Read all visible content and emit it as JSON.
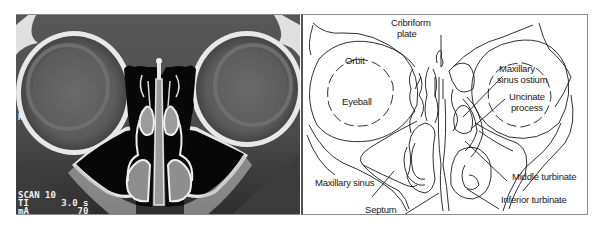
{
  "figure": {
    "left_panel": {
      "type": "coronal CT scan of paranasal sinuses",
      "orientation_marker": "R",
      "scan_info": [
        {
          "key": "SCAN",
          "value": "10"
        },
        {
          "key": "TI",
          "value": "3.0 s"
        },
        {
          "key": "mA",
          "value": "70"
        }
      ],
      "scan_lines": [
        "SCAN 10",
        "TI      3.0 s",
        "mA         70"
      ]
    },
    "right_panel": {
      "type": "labeled line drawing",
      "labels": {
        "orbit": "Orbit",
        "eyeball": "Eyeball",
        "cribriform_line1": "Cribriform",
        "cribriform_line2": "plate",
        "ostium_line1": "Maxillary",
        "ostium_line2": "sinus ostium",
        "uncinate_line1": "Uncinate",
        "uncinate_line2": "process",
        "maxillary_sinus": "Maxillary sinus",
        "septum": "Septum",
        "middle_turbinate": "Middle turbinate",
        "inferior_turbinate": "Inferior turbinate"
      }
    },
    "colors": {
      "ct_background": "#4a4a4a",
      "air": "#050505",
      "bone": "#f2f2f2",
      "line_art": "#1a1a1a",
      "panel_border": "#8c8c8c"
    }
  }
}
